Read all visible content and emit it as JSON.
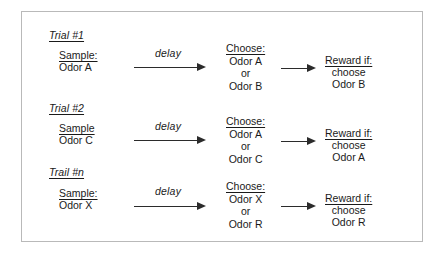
{
  "figure": {
    "border_color": "#b9b9b9",
    "background_color": "#ffffff",
    "ink_color": "#1a1a1a",
    "arrow_color": "#2b2b2b"
  },
  "trials": [
    {
      "trial_label": "Trial #1",
      "sample_title": "Sample:",
      "sample_value": "Odor A",
      "delay_label": "delay",
      "choose_title": "Choose:",
      "choose_option_a": "Odor A",
      "choose_conjunction": "or",
      "choose_option_b": "Odor B",
      "reward_title": "Reward if:",
      "reward_line_1": "choose",
      "reward_line_2": "Odor B"
    },
    {
      "trial_label": "Trial #2",
      "sample_title": "Sample",
      "sample_value": "Odor C",
      "delay_label": "delay",
      "choose_title": "Choose:",
      "choose_option_a": "Odor A",
      "choose_conjunction": "or",
      "choose_option_b": "Odor C",
      "reward_title": "Reward if:",
      "reward_line_1": "choose",
      "reward_line_2": "Odor A"
    },
    {
      "trial_label": "Trail #n",
      "sample_title": "Sample:",
      "sample_value": "Odor X",
      "delay_label": "delay",
      "choose_title": "Choose:",
      "choose_option_a": "Odor X",
      "choose_conjunction": "or",
      "choose_option_b": "Odor R",
      "reward_title": "Reward if:",
      "reward_line_1": "choose",
      "reward_line_2": "Odor R"
    }
  ]
}
